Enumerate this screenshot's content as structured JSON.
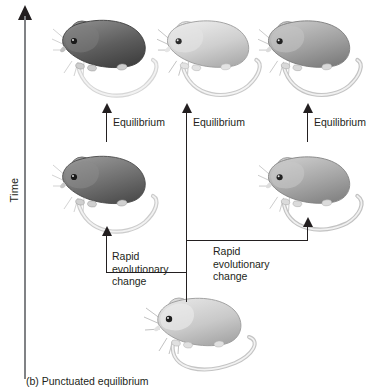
{
  "figure": {
    "caption": "(b) Punctuated equilibrium",
    "axis": {
      "label": "Time",
      "direction": "upward",
      "arrow_icon": "arrow-up-icon"
    }
  },
  "labels": {
    "equilibrium_left": "Equilibrium",
    "equilibrium_middle": "Equilibrium",
    "equilibrium_right": "Equilibrium",
    "rapid_change_left": "Rapid evolutionary\nchange",
    "rapid_change_right": "Rapid evolutionary\nchange"
  },
  "organisms": [
    {
      "id": "ancestor",
      "name": "mouse-ancestral",
      "row": "bottom",
      "column": "center",
      "shade": "#c9c9c9",
      "shade_name": "light-gray"
    },
    {
      "id": "lineage-left-mid",
      "name": "mouse-left-middle",
      "row": "middle",
      "column": "left",
      "shade": "#6e6e6e",
      "shade_name": "dark-gray"
    },
    {
      "id": "lineage-right-mid",
      "name": "mouse-right-middle",
      "row": "middle",
      "column": "right",
      "shade": "#a5a5a5",
      "shade_name": "medium-gray"
    },
    {
      "id": "lineage-left-top",
      "name": "mouse-left-top",
      "row": "top",
      "column": "left",
      "shade": "#5d5d5d",
      "shade_name": "dark-gray"
    },
    {
      "id": "lineage-mid-top",
      "name": "mouse-middle-top",
      "row": "top",
      "column": "middle",
      "shade": "#cfcfcf",
      "shade_name": "very-light-gray"
    },
    {
      "id": "lineage-right-top",
      "name": "mouse-right-top",
      "row": "top",
      "column": "right",
      "shade": "#a0a0a0",
      "shade_name": "medium-gray"
    }
  ],
  "colors": {
    "axis": "#808285",
    "line": "#231f20",
    "text": "#231f20",
    "background": "#ffffff"
  }
}
